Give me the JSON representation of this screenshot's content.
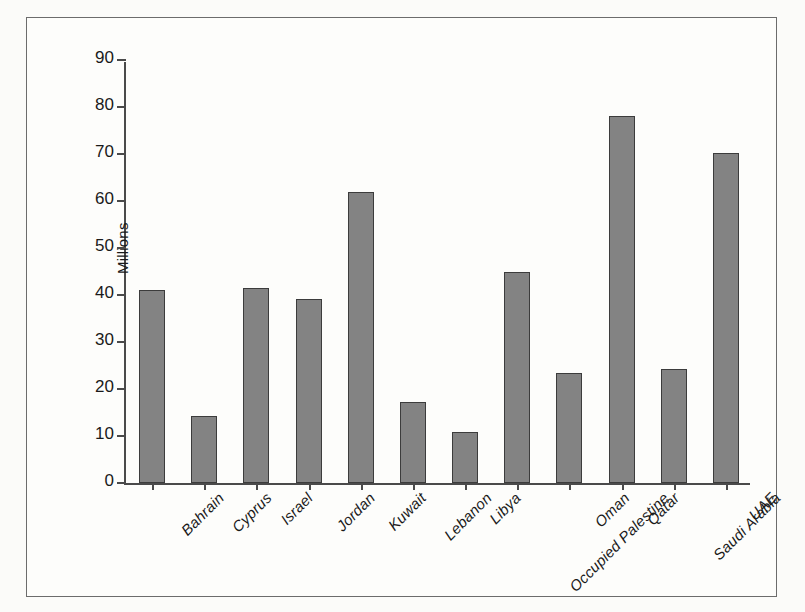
{
  "chart_data": {
    "type": "bar",
    "title": "",
    "xlabel": "",
    "ylabel": "Millions",
    "ylim": [
      0,
      90
    ],
    "yticks": [
      0,
      10,
      20,
      30,
      40,
      50,
      60,
      70,
      80,
      90
    ],
    "grid": false,
    "legend": "none",
    "bar_color": "#838383",
    "bar_edge_color": "#3c3c3c",
    "axis_color": "#4a4a4a",
    "categories": [
      "Bahrain",
      "Cyprus",
      "Israel",
      "Jordan",
      "Kuwait",
      "Lebanon",
      "Libya",
      "Occupied Palestine",
      "Oman",
      "Qatar",
      "Saudi Arabia",
      "UAE"
    ],
    "values": [
      41,
      14.3,
      41.5,
      39.1,
      62,
      17.2,
      10.9,
      45,
      23.4,
      78,
      24.3,
      70.2
    ]
  }
}
